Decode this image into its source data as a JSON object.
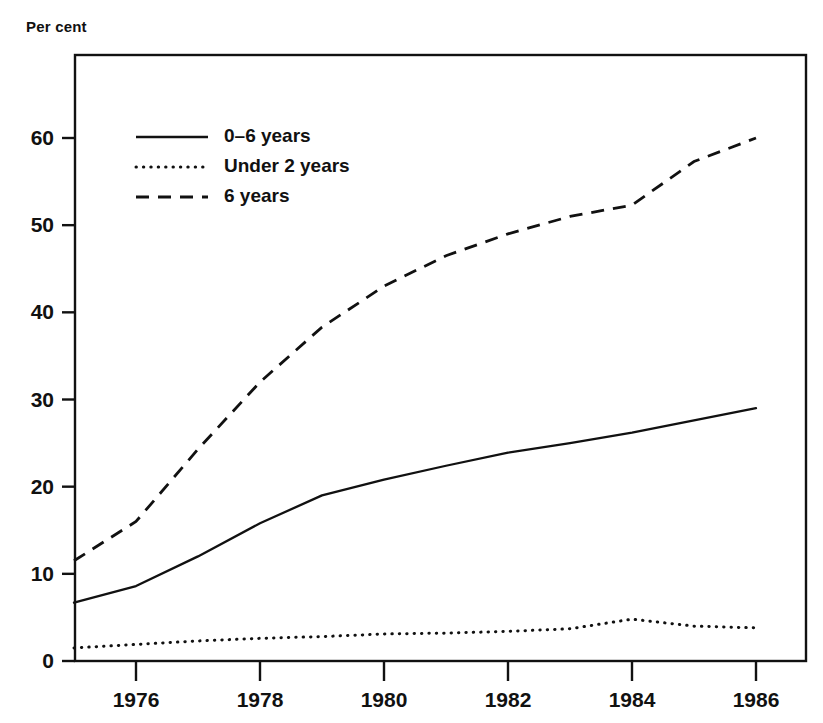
{
  "chart_data": {
    "type": "line",
    "title": "",
    "subtitle": "",
    "ylabel": "Per cent",
    "xlabel": "",
    "xlim": [
      1975,
      1986
    ],
    "ylim": [
      0,
      65
    ],
    "grid": false,
    "legend_position": "top-left",
    "x_ticks": [
      "1976",
      "1978",
      "1980",
      "1982",
      "1984",
      "1986"
    ],
    "x_tick_values": [
      1976,
      1978,
      1980,
      1982,
      1984,
      1986
    ],
    "y_ticks": [
      "0",
      "10",
      "20",
      "30",
      "40",
      "50",
      "60"
    ],
    "y_tick_values": [
      0,
      10,
      20,
      30,
      40,
      50,
      60
    ],
    "x": [
      1975,
      1976,
      1977,
      1978,
      1979,
      1980,
      1981,
      1982,
      1983,
      1984,
      1985,
      1986
    ],
    "series": [
      {
        "name": "0–6 years",
        "style": "solid",
        "values": [
          6.7,
          8.6,
          12.0,
          15.8,
          19.0,
          20.8,
          22.4,
          23.9,
          25.0,
          26.2,
          27.6,
          29.0
        ]
      },
      {
        "name": "Under 2 years",
        "style": "dotted",
        "values": [
          1.5,
          1.9,
          2.3,
          2.6,
          2.8,
          3.1,
          3.2,
          3.4,
          3.7,
          4.8,
          4.0,
          3.8
        ]
      },
      {
        "name": "6 years",
        "style": "dashed",
        "values": [
          11.5,
          16.0,
          24.3,
          32.0,
          38.3,
          43.0,
          46.5,
          49.0,
          51.0,
          52.3,
          57.3,
          60.0
        ]
      }
    ]
  },
  "legend": {
    "items": [
      {
        "label": "0–6 years",
        "style": "solid"
      },
      {
        "label": "Under 2 years",
        "style": "dotted"
      },
      {
        "label": "6 years",
        "style": "dashed"
      }
    ]
  }
}
